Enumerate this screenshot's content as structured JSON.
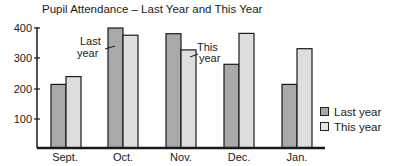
{
  "chart_data": {
    "type": "bar",
    "title": "Pupil Attendance – Last Year and This Year",
    "categories": [
      "Sept.",
      "Oct.",
      "Nov.",
      "Dec.",
      "Jan."
    ],
    "series": [
      {
        "name": "Last year",
        "values": [
          212,
          400,
          381,
          279,
          212
        ],
        "color": "#a9a9a9"
      },
      {
        "name": "This year",
        "values": [
          238,
          376,
          327,
          382,
          331
        ],
        "color": "#dedede"
      }
    ],
    "xlabel": "",
    "ylabel": "",
    "yticks": [
      100,
      200,
      300,
      400
    ],
    "ylim": [
      0,
      400
    ],
    "grid": false,
    "legend_position": "right",
    "annotations": [
      {
        "text": "Last year",
        "target": "Oct. Last year bar"
      },
      {
        "text": "This year",
        "target": "Nov. This year bar"
      }
    ]
  },
  "title": "Pupil Attendance – Last Year and This Year",
  "yticks": [
    "100",
    "200",
    "300",
    "400"
  ],
  "categories": [
    "Sept.",
    "Oct.",
    "Nov.",
    "Dec.",
    "Jan."
  ],
  "annotations": {
    "last_line1": "Last",
    "last_line2": "year",
    "this_line1": "This",
    "this_line2": "year"
  },
  "legend": {
    "last_year": "Last year",
    "this_year": "This year"
  }
}
